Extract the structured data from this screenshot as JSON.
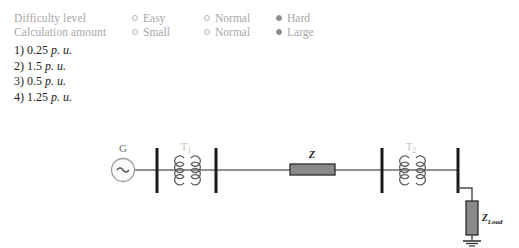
{
  "meta": {
    "rows": [
      {
        "label": "Difficulty level",
        "options": [
          {
            "text": "Easy",
            "selected": false
          },
          {
            "text": "Normal",
            "selected": false
          },
          {
            "text": "Hard",
            "selected": true
          }
        ]
      },
      {
        "label": "Calculation amount",
        "options": [
          {
            "text": "Small",
            "selected": false
          },
          {
            "text": "Normal",
            "selected": false
          },
          {
            "text": "Large",
            "selected": true
          }
        ]
      }
    ]
  },
  "answers": [
    {
      "number": "1)",
      "value": "0.25",
      "unit": "p. u."
    },
    {
      "number": "2)",
      "value": "1.5",
      "unit": "p. u."
    },
    {
      "number": "3)",
      "value": "0.5",
      "unit": "p. u."
    },
    {
      "number": "4)",
      "value": "1.25",
      "unit": "p. u."
    }
  ],
  "diagram": {
    "type": "single-line-power-system",
    "labels": {
      "generator": "G",
      "transformer_1": "T",
      "transformer_1_sub": "1",
      "transformer_2": "T",
      "transformer_2_sub": "2",
      "line_impedance": "Z",
      "load_impedance": "Z",
      "load_impedance_sub": "Load"
    },
    "colors": {
      "wire": "#6b6b6b",
      "bus": "#1a1a1a",
      "box_fill": "#8a8a8a",
      "box_stroke": "#2b2b2b",
      "label_faint": "#b9b9b9",
      "label_dark": "#1a1a1a"
    }
  }
}
